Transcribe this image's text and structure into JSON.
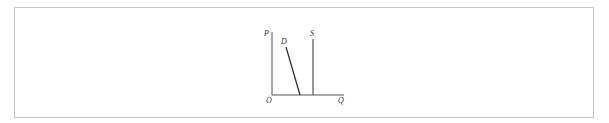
{
  "diagram": {
    "axes": {
      "y_label": "P",
      "x_label": "Q",
      "origin_label": "O"
    },
    "curves": [
      {
        "label": "D",
        "type": "demand",
        "shape": "steep downward sloping line"
      },
      {
        "label": "S",
        "type": "supply",
        "shape": "vertical line"
      }
    ]
  }
}
